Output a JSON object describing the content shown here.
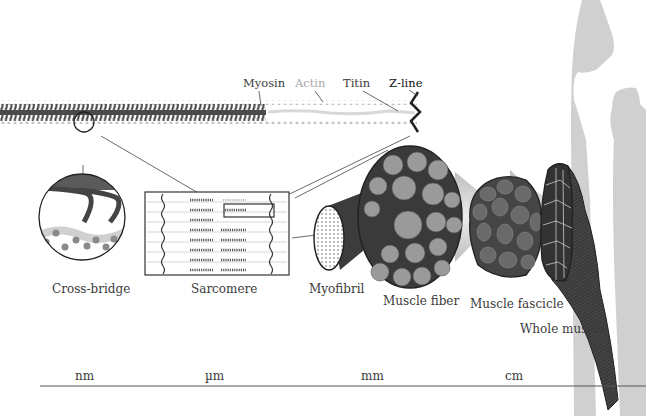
{
  "filament_labels": {
    "myosin": "Myosin",
    "actin": "Actin",
    "titin": "Titin",
    "z_line": "Z-line"
  },
  "structure_labels": {
    "cross_bridge": "Cross-bridge",
    "sarcomere": "Sarcomere",
    "myofibril": "Myofibril",
    "muscle_fiber": "Muscle fiber",
    "muscle_fascicle": "Muscle fascicle",
    "whole_muscle": "Whole muscle"
  },
  "scale_axis": {
    "ticks": [
      "nm",
      "µm",
      "mm",
      "cm"
    ]
  },
  "colors": {
    "myosin": "#4a4a4a",
    "actin": "#b8b8b8",
    "actin_label": "#a8a8a8",
    "z_line": "#222222",
    "bone": "#d0d0d0",
    "fiber_fill": "#9a9a9a",
    "muscle_dark": "#3a3a3a",
    "axis_line": "#555555"
  }
}
